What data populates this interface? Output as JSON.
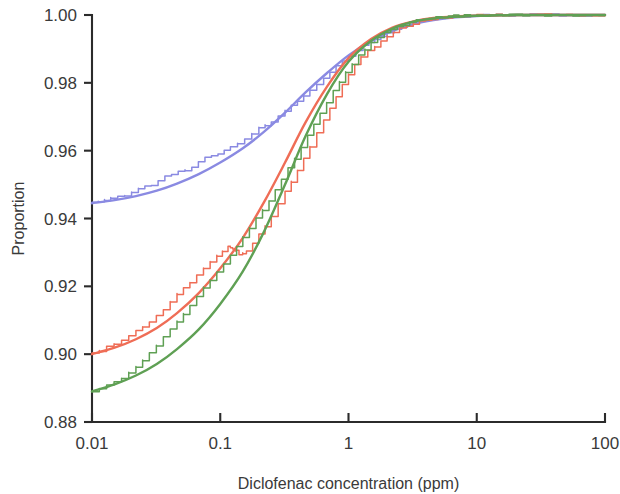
{
  "chart_data": {
    "type": "line",
    "title": "",
    "xlabel": "Diclofenac concentration (ppm)",
    "ylabel": "Proportion",
    "xscale": "log",
    "yscale": "linear",
    "xlim": [
      0.01,
      100
    ],
    "ylim": [
      0.88,
      1.0
    ],
    "grid": false,
    "legend": "none",
    "xticklabels": [
      "0.01",
      "0.1",
      "1",
      "10",
      "100"
    ],
    "xtickvalues": [
      0.01,
      0.1,
      1,
      10,
      100
    ],
    "yticklabels": [
      "1.00",
      "0.98",
      "0.96",
      "0.94",
      "0.92",
      "0.90",
      "0.88"
    ],
    "ytickvalues": [
      1.0,
      0.98,
      0.96,
      0.94,
      0.92,
      0.9,
      0.88
    ],
    "colors": {
      "series_blue": "#8a8ae2",
      "series_red": "#ef6d56",
      "series_green": "#5fa054",
      "axis": "#2b2b2b",
      "text": "#3a3a3a",
      "background": "#ffffff"
    },
    "series": [
      {
        "name": "blue-distribution-fit",
        "color": "#8a8ae2",
        "style": "smooth-fit",
        "x": [
          0.01,
          0.015,
          0.022,
          0.032,
          0.046,
          0.068,
          0.1,
          0.15,
          0.22,
          0.32,
          0.46,
          0.68,
          1.0,
          1.5,
          2.2,
          3.2,
          4.6,
          6.8,
          10.0,
          15.0,
          22.0,
          32.0,
          46.0,
          68.0,
          100.0
        ],
        "y": [
          0.9445,
          0.9454,
          0.9466,
          0.9482,
          0.9503,
          0.9531,
          0.9565,
          0.9607,
          0.9656,
          0.9712,
          0.9771,
          0.9829,
          0.9881,
          0.9923,
          0.9953,
          0.9973,
          0.9985,
          0.9993,
          0.9997,
          0.9999,
          1.0,
          1.0,
          1.0,
          1.0,
          1.0
        ]
      },
      {
        "name": "blue-distribution-empirical",
        "color": "#8a8ae2",
        "style": "stepped-empirical",
        "x": [
          0.01,
          0.014,
          0.018,
          0.023,
          0.029,
          0.037,
          0.047,
          0.06,
          0.076,
          0.096,
          0.12,
          0.155,
          0.2,
          0.25,
          0.32,
          0.4,
          0.5,
          0.64,
          0.8,
          1.0,
          1.3,
          1.6,
          2.0,
          2.6,
          3.2,
          4.0,
          5.0,
          6.5,
          8.0,
          10.0,
          20.0,
          50.0,
          100.0
        ],
        "y": [
          0.9445,
          0.9462,
          0.9468,
          0.9489,
          0.9497,
          0.9522,
          0.9537,
          0.9551,
          0.9579,
          0.9588,
          0.9611,
          0.9632,
          0.9669,
          0.9684,
          0.9719,
          0.9744,
          0.9781,
          0.9812,
          0.9848,
          0.9879,
          0.9909,
          0.9928,
          0.9947,
          0.9965,
          0.9976,
          0.9985,
          0.9991,
          0.9995,
          0.9997,
          0.9999,
          1.0,
          1.0,
          1.0
        ]
      },
      {
        "name": "red-distribution-fit",
        "color": "#ef6d56",
        "style": "smooth-fit",
        "x": [
          0.01,
          0.015,
          0.022,
          0.032,
          0.046,
          0.068,
          0.1,
          0.15,
          0.22,
          0.32,
          0.46,
          0.68,
          1.0,
          1.5,
          2.2,
          3.2,
          4.6,
          6.8,
          10.0,
          15.0,
          22.0,
          32.0,
          46.0,
          68.0,
          100.0
        ],
        "y": [
          0.9,
          0.9019,
          0.9044,
          0.9077,
          0.9121,
          0.918,
          0.9253,
          0.9343,
          0.9449,
          0.9565,
          0.9682,
          0.9789,
          0.9873,
          0.9929,
          0.9963,
          0.9981,
          0.9991,
          0.9996,
          0.9998,
          0.9999,
          1.0,
          1.0,
          1.0,
          1.0,
          1.0
        ]
      },
      {
        "name": "red-distribution-empirical",
        "color": "#ef6d56",
        "style": "stepped-empirical",
        "x": [
          0.01,
          0.013,
          0.017,
          0.022,
          0.028,
          0.036,
          0.046,
          0.058,
          0.074,
          0.094,
          0.115,
          0.125,
          0.14,
          0.16,
          0.2,
          0.25,
          0.32,
          0.4,
          0.5,
          0.64,
          0.8,
          1.0,
          1.25,
          1.6,
          2.0,
          2.5,
          3.2,
          4.0,
          5.0,
          6.5,
          8.0,
          10.0,
          20.0,
          50.0,
          100.0
        ],
        "y": [
          0.9,
          0.9022,
          0.9039,
          0.9068,
          0.9093,
          0.9131,
          0.9179,
          0.9211,
          0.9254,
          0.9292,
          0.9317,
          0.9312,
          0.9295,
          0.9303,
          0.9351,
          0.9406,
          0.9478,
          0.9542,
          0.9612,
          0.9689,
          0.9758,
          0.9826,
          0.9878,
          0.9907,
          0.9939,
          0.9959,
          0.9975,
          0.9985,
          0.9991,
          0.9996,
          0.9998,
          0.9999,
          1.0,
          1.0,
          1.0
        ]
      },
      {
        "name": "green-distribution-fit",
        "color": "#5fa054",
        "style": "smooth-fit",
        "x": [
          0.01,
          0.015,
          0.022,
          0.032,
          0.046,
          0.068,
          0.1,
          0.15,
          0.22,
          0.32,
          0.46,
          0.68,
          1.0,
          1.5,
          2.2,
          3.2,
          4.6,
          6.8,
          10.0,
          15.0,
          22.0,
          32.0,
          46.0,
          68.0,
          100.0
        ],
        "y": [
          0.889,
          0.8911,
          0.8937,
          0.8971,
          0.9015,
          0.9073,
          0.9148,
          0.9244,
          0.9362,
          0.95,
          0.9641,
          0.9767,
          0.9862,
          0.9924,
          0.996,
          0.998,
          0.999,
          0.9995,
          0.9998,
          0.9999,
          1.0,
          1.0,
          1.0,
          1.0,
          1.0
        ]
      },
      {
        "name": "green-distribution-empirical",
        "color": "#5fa054",
        "style": "stepped-empirical",
        "x": [
          0.01,
          0.013,
          0.017,
          0.022,
          0.028,
          0.036,
          0.046,
          0.058,
          0.074,
          0.094,
          0.12,
          0.15,
          0.19,
          0.24,
          0.3,
          0.38,
          0.48,
          0.6,
          0.76,
          0.95,
          1.2,
          1.5,
          1.9,
          2.4,
          3.0,
          3.8,
          4.8,
          6.0,
          8.0,
          10.0,
          20.0,
          50.0,
          100.0
        ],
        "y": [
          0.889,
          0.8908,
          0.8929,
          0.8964,
          0.9002,
          0.9051,
          0.9098,
          0.9142,
          0.9198,
          0.9241,
          0.9289,
          0.9346,
          0.9401,
          0.9452,
          0.9516,
          0.9578,
          0.9643,
          0.9709,
          0.9775,
          0.9833,
          0.988,
          0.9919,
          0.9946,
          0.9966,
          0.9979,
          0.9987,
          0.9993,
          0.9996,
          0.9998,
          0.9999,
          1.0,
          1.0,
          1.0
        ]
      }
    ]
  }
}
